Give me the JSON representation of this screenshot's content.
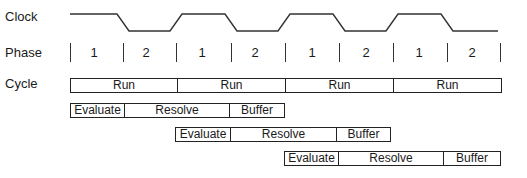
{
  "rows": {
    "clock": "Clock",
    "phase": "Phase",
    "cycle": "Cycle"
  },
  "phases": [
    "1",
    "2",
    "1",
    "2",
    "1",
    "2",
    "1",
    "2"
  ],
  "cycle": [
    "Run",
    "Run",
    "Run",
    "Run"
  ],
  "pipelines": [
    {
      "stages": [
        "Evaluate",
        "Resolve",
        "Buffer"
      ]
    },
    {
      "stages": [
        "Evaluate",
        "Resolve",
        "Buffer"
      ]
    },
    {
      "stages": [
        "Evaluate",
        "Resolve",
        "Buffer"
      ]
    }
  ]
}
